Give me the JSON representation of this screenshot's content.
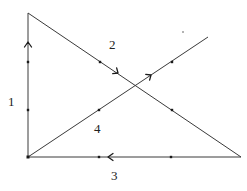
{
  "diagram": {
    "title": "",
    "colors": {
      "line": "#3a3a3a",
      "node": "#1a1a1a",
      "label": "#222222",
      "background": "#ffffff"
    },
    "vertices": {
      "top_left": [
        28,
        13
      ],
      "bottom_left": [
        28,
        157
      ],
      "bottom_right": [
        241,
        157
      ],
      "upper_right_end": [
        208,
        37
      ]
    },
    "edges": [
      {
        "id": "edge-1",
        "label": "1",
        "from": "bottom_left",
        "to": "top_left",
        "direction": "up"
      },
      {
        "id": "edge-2",
        "label": "2",
        "from": "top_left",
        "to": "bottom_right",
        "direction": "down-right"
      },
      {
        "id": "edge-3",
        "label": "3",
        "from": "bottom_right",
        "to": "bottom_left",
        "direction": "left"
      },
      {
        "id": "edge-4",
        "label": "4",
        "from": "bottom_left",
        "to": "upper_right_end",
        "direction": "up-right"
      }
    ],
    "labels": {
      "edge_1": "1",
      "edge_2": "2",
      "edge_3": "3",
      "edge_4": "4"
    },
    "marked_points": [
      [
        28,
        62
      ],
      [
        28,
        110
      ],
      [
        100,
        62
      ],
      [
        172,
        110
      ],
      [
        99,
        157
      ],
      [
        171,
        157
      ],
      [
        99,
        110
      ],
      [
        172,
        62
      ]
    ]
  }
}
